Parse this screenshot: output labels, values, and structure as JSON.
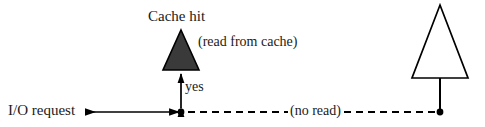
{
  "diagram": {
    "title_label": "Cache hit",
    "cache_note_label": "(read from cache)",
    "yes_label": "yes",
    "io_request_label": "I/O request",
    "no_read_label": "(no read)",
    "colors": {
      "background": "#ffffff",
      "stroke": "#000000",
      "filled_triangle_fill": "#3a3a3a",
      "text": "#1a1a1a"
    },
    "shapes": {
      "filled_triangle": {
        "name": "cache-hit-triangle",
        "filled": true,
        "apex_x": 181,
        "apex_y": 30,
        "base_left_x": 163,
        "base_right_x": 199,
        "base_y": 70
      },
      "outline_triangle": {
        "name": "no-read-triangle",
        "filled": false,
        "apex_x": 440,
        "apex_y": 5,
        "base_left_x": 412,
        "base_right_x": 468,
        "base_y": 78
      }
    },
    "connectors": {
      "baseline_y": 112,
      "solid_arrow": {
        "name": "io-request-arrow",
        "style": "solid",
        "x_start": 82,
        "x_end": 181,
        "arrow_start": true,
        "arrow_end": true
      },
      "dashed_line": {
        "name": "no-read-dashed-line",
        "style": "dashed",
        "x_start": 188,
        "x_end": 440,
        "dash_pattern": "7,5"
      },
      "vertical_yes_arrow": {
        "name": "yes-connector",
        "style": "solid",
        "x": 181,
        "y_top": 72,
        "y_bottom": 110,
        "arrow_top": true,
        "arrow_bottom": true
      },
      "vertical_stem": {
        "name": "no-read-stem",
        "style": "solid",
        "x": 440,
        "y_top": 78,
        "y_bottom": 112
      }
    },
    "nodes": [
      {
        "name": "junction-node-left",
        "x": 181,
        "y": 112,
        "radius": 3.4
      },
      {
        "name": "junction-node-right",
        "x": 440,
        "y": 112,
        "radius": 3.4
      }
    ]
  }
}
